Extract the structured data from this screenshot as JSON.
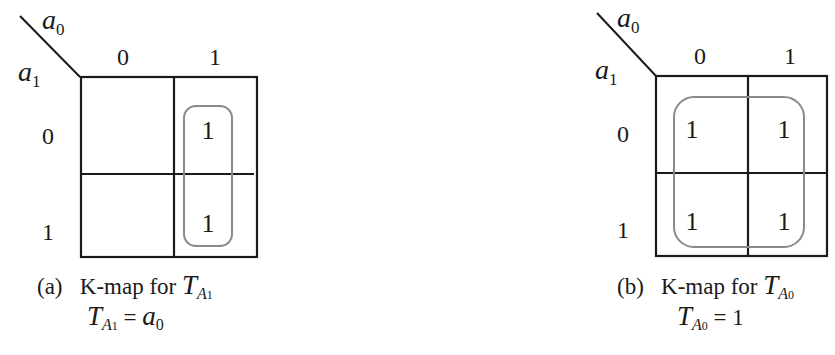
{
  "maps": [
    {
      "id": "a",
      "col_var": "a",
      "col_var_sub": "0",
      "row_var": "a",
      "row_var_sub": "1",
      "col_labels": [
        "0",
        "1"
      ],
      "row_labels": [
        "0",
        "1"
      ],
      "cells": [
        [
          "",
          "1"
        ],
        [
          "",
          "1"
        ]
      ],
      "caption_tag": "(a)",
      "caption_text": "K-map for",
      "caption_func": "T",
      "caption_func_sub": "A",
      "caption_func_subsub": "1",
      "equation_lhs": "T",
      "equation_lhs_sub": "A",
      "equation_lhs_subsub": "1",
      "equation_eq": "=",
      "equation_rhs": "a",
      "equation_rhs_sub": "0"
    },
    {
      "id": "b",
      "col_var": "a",
      "col_var_sub": "0",
      "row_var": "a",
      "row_var_sub": "1",
      "col_labels": [
        "0",
        "1"
      ],
      "row_labels": [
        "0",
        "1"
      ],
      "cells": [
        [
          "1",
          "1"
        ],
        [
          "1",
          "1"
        ]
      ],
      "caption_tag": "(b)",
      "caption_text": "K-map for",
      "caption_func": "T",
      "caption_func_sub": "A",
      "caption_func_subsub": "0",
      "equation_lhs": "T",
      "equation_lhs_sub": "A",
      "equation_lhs_subsub": "0",
      "equation_eq": "=",
      "equation_rhs": "1",
      "equation_rhs_sub": ""
    }
  ],
  "colors": {
    "grid": "#1a1a1a",
    "loop": "#8a8a8a",
    "background": "#ffffff"
  }
}
